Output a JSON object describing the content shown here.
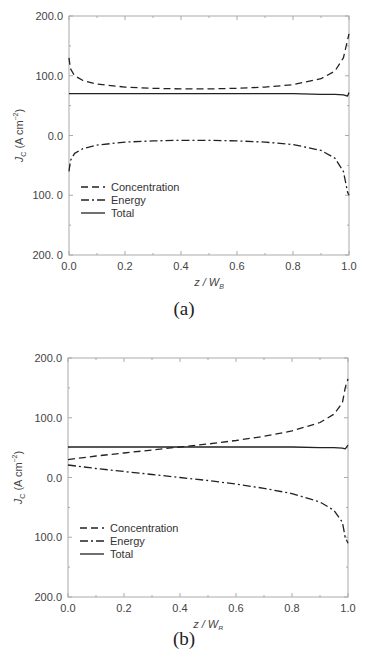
{
  "figure": {
    "panels": [
      {
        "caption": "(a)",
        "xlabel_main": "z / W",
        "xlabel_sub": "B",
        "ylabel_main": "J",
        "ylabel_sub": "C",
        "ylabel_unit": " (A cm",
        "ylabel_exp": "−2",
        "ylabel_close": ")",
        "yticks": [
          "200.0",
          "100.0",
          "0.0",
          "100. 0",
          "200. 0"
        ],
        "xticks": [
          "0.0",
          "0.2",
          "0.4",
          "0.6",
          "0.8",
          "1.0"
        ],
        "legend": [
          "Concentration",
          "Energy",
          "Total"
        ]
      },
      {
        "caption": "(b)",
        "xlabel_main": "z / W",
        "xlabel_sub": "B",
        "ylabel_main": "J",
        "ylabel_sub": "C",
        "ylabel_unit": " (A cm",
        "ylabel_exp": "−2",
        "ylabel_close": ")",
        "yticks": [
          "200.0",
          "100.0",
          "0.0",
          "100.0",
          "200.0"
        ],
        "xticks": [
          "0.0",
          "0.2",
          "0.4",
          "0.6",
          "0.8",
          "1.0"
        ],
        "legend": [
          "Concentration",
          "Energy",
          "Total"
        ]
      }
    ]
  },
  "chart_data": [
    {
      "type": "line",
      "title": "(a)",
      "xlabel": "z / W_B",
      "ylabel": "J_C (A cm^-2)",
      "xlim": [
        0.0,
        1.0
      ],
      "ylim": [
        -200,
        200
      ],
      "ytick_labels": [
        "200.0",
        "100.0",
        "0.0",
        "100. 0",
        "200. 0"
      ],
      "xtick_labels": [
        "0.0",
        "0.2",
        "0.4",
        "0.6",
        "0.8",
        "1.0"
      ],
      "grid": false,
      "legend_position": "lower left",
      "x": [
        0.0,
        0.005,
        0.02,
        0.05,
        0.1,
        0.2,
        0.3,
        0.4,
        0.5,
        0.6,
        0.7,
        0.8,
        0.9,
        0.95,
        0.98,
        0.995,
        1.0
      ],
      "series": [
        {
          "name": "Concentration",
          "style": "dashed",
          "values": [
            130,
            112,
            100,
            92,
            86,
            81,
            79,
            78,
            78,
            79,
            81,
            85,
            95,
            108,
            130,
            160,
            170
          ]
        },
        {
          "name": "Energy",
          "style": "dash-dot",
          "values": [
            -60,
            -42,
            -30,
            -22,
            -16,
            -11,
            -9,
            -8,
            -8,
            -9,
            -11,
            -15,
            -25,
            -38,
            -60,
            -95,
            -100
          ]
        },
        {
          "name": "Total",
          "style": "solid",
          "values": [
            70,
            70,
            70,
            70,
            70,
            70,
            70,
            70,
            70,
            70,
            70,
            70,
            69,
            69,
            68,
            66,
            72
          ]
        }
      ]
    },
    {
      "type": "line",
      "title": "(b)",
      "xlabel": "z / W_B",
      "ylabel": "J_C (A cm^-2)",
      "xlim": [
        0.0,
        1.0
      ],
      "ylim": [
        -200,
        200
      ],
      "ytick_labels": [
        "200.0",
        "100.0",
        "0.0",
        "100.0",
        "200.0"
      ],
      "xtick_labels": [
        "0.0",
        "0.2",
        "0.4",
        "0.6",
        "0.8",
        "1.0"
      ],
      "grid": false,
      "legend_position": "lower left",
      "x": [
        0.0,
        0.1,
        0.2,
        0.3,
        0.4,
        0.5,
        0.6,
        0.7,
        0.8,
        0.9,
        0.95,
        0.98,
        0.99,
        1.0
      ],
      "series": [
        {
          "name": "Concentration",
          "style": "dashed",
          "values": [
            30,
            36,
            41,
            46,
            51,
            56,
            62,
            69,
            78,
            92,
            106,
            125,
            150,
            165
          ]
        },
        {
          "name": "Energy",
          "style": "dash-dot",
          "values": [
            21,
            15,
            10,
            5,
            0,
            -5,
            -11,
            -18,
            -27,
            -41,
            -55,
            -75,
            -100,
            -110
          ]
        },
        {
          "name": "Total",
          "style": "solid",
          "values": [
            51,
            51,
            51,
            51,
            51,
            51,
            51,
            51,
            51,
            50,
            50,
            49,
            48,
            54
          ]
        }
      ]
    }
  ]
}
